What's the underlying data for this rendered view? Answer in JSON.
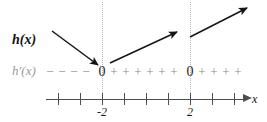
{
  "figure": {
    "type": "sign-chart",
    "width": 267,
    "height": 122,
    "background": "#ffffff",
    "colors": {
      "ink": "#121212",
      "axis": "#4f4f4f",
      "sign_gray": "#8e8e8e",
      "guide_gray": "#b9b9b9"
    }
  },
  "labels": {
    "function_label": "h(x)",
    "derivative_label": "h′(x)",
    "axis_label": "x"
  },
  "number_line": {
    "tick_count": 9,
    "tick_values": [
      -4,
      -3,
      -2,
      -1,
      0,
      1,
      2,
      3,
      4
    ],
    "tick_x_px": [
      58,
      80,
      102,
      124,
      146,
      168,
      190,
      212,
      234
    ],
    "labeled_ticks": [
      {
        "value": "-2",
        "x_px": 102
      },
      {
        "value": "2",
        "x_px": 190
      }
    ],
    "arrow_direction": "right"
  },
  "critical_points": [
    {
      "label": "0",
      "x_px": 102,
      "x_value": -2
    },
    {
      "label": "0",
      "x_px": 190,
      "x_value": 2
    }
  ],
  "sign_row": {
    "description": "Sign of h'(x) along the number line",
    "marks": [
      {
        "symbol": "−",
        "x_px": 50
      },
      {
        "symbol": "−",
        "x_px": 62
      },
      {
        "symbol": "−",
        "x_px": 74
      },
      {
        "symbol": "−",
        "x_px": 86
      },
      {
        "symbol": "0",
        "x_px": 102
      },
      {
        "symbol": "+",
        "x_px": 114
      },
      {
        "symbol": "+",
        "x_px": 126
      },
      {
        "symbol": "+",
        "x_px": 138
      },
      {
        "symbol": "+",
        "x_px": 150
      },
      {
        "symbol": "+",
        "x_px": 162
      },
      {
        "symbol": "+",
        "x_px": 174
      },
      {
        "symbol": "0",
        "x_px": 190
      },
      {
        "symbol": "+",
        "x_px": 202
      },
      {
        "symbol": "+",
        "x_px": 214
      },
      {
        "symbol": "+",
        "x_px": 226
      },
      {
        "symbol": "+",
        "x_px": 238
      }
    ],
    "intervals": [
      {
        "range": "x < -2",
        "sign": "negative"
      },
      {
        "range": "-2 < x < 2",
        "sign": "positive"
      },
      {
        "range": "x > 2",
        "sign": "positive"
      }
    ]
  },
  "guides": [
    {
      "x_px": 102,
      "y_top": 2,
      "y_bottom": 99
    },
    {
      "x_px": 190,
      "y_top": 2,
      "y_bottom": 99
    }
  ],
  "slope_arrows": [
    {
      "name": "decreasing-arrow",
      "x1": 52,
      "y1": 31,
      "x2": 99,
      "y2": 66
    },
    {
      "name": "increasing-arrow-middle",
      "x1": 110,
      "y1": 63,
      "x2": 178,
      "y2": 31
    },
    {
      "name": "increasing-arrow-right",
      "x1": 190,
      "y1": 37,
      "x2": 248,
      "y2": 7
    }
  ]
}
